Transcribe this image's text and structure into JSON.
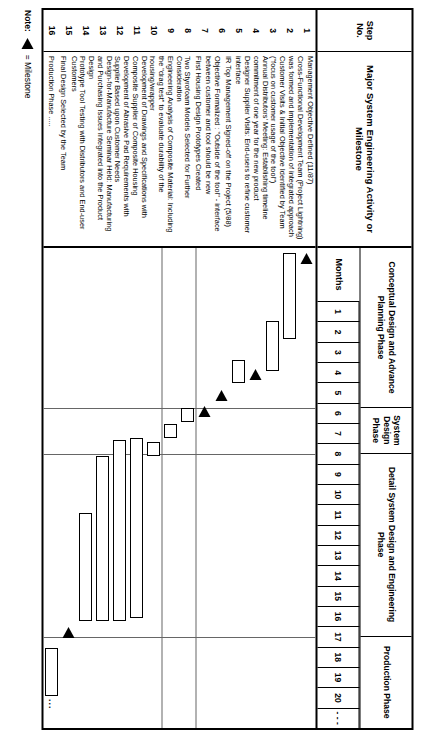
{
  "headers": {
    "step_no": "Step\nNo.",
    "step_no_line1": "Step",
    "step_no_line2": "No.",
    "activity": "Major System Engineering Activity or Milestone",
    "months": "Months"
  },
  "phases": [
    {
      "label": "Conceptual Design and Advance Planning Phase",
      "start_month": 1,
      "end_month": 7
    },
    {
      "label": "System Design Phase",
      "start_month": 8,
      "end_month": 9
    },
    {
      "label": "Detail System Design and Engineering Phase",
      "start_month": 10,
      "end_month": 17
    },
    {
      "label": "Production Phase",
      "start_month": 18,
      "end_month": 21
    }
  ],
  "month_ticks": [
    "1",
    "2",
    "3",
    "4",
    "5",
    "6",
    "7",
    "8",
    "9",
    "10",
    "11",
    "12",
    "13",
    "14",
    "15",
    "16",
    "17",
    "18",
    "19",
    "20",
    "- - -"
  ],
  "rows": [
    {
      "no": "1",
      "activity": "Management Objective Defined (11/87)"
    },
    {
      "no": "2",
      "activity": "Cross-Functional Development Team (Project Lightning) was formed and implementation of integrated approach"
    },
    {
      "no": "3",
      "activity": "Customer Visits & Initial Objective Identified by Team (\"focus on customer usage of the tool\")"
    },
    {
      "no": "4",
      "activity": "Annual Distributors' Meeting: Establishing timeline commitment of one year for the new product"
    },
    {
      "no": "5",
      "activity": "Designer Supplier Visits: End-users to refine customer interface"
    },
    {
      "no": "6",
      "activity": "IR Top Management Signed-off on the Project (5/88)"
    },
    {
      "no": "7",
      "activity": "Objective Formalized : \"Outside of the tool\" - interface between customer and tool should be new"
    },
    {
      "no": "8",
      "activity": "First Housing Design Prototypes Created"
    },
    {
      "no": "9",
      "activity": "Two Styrofoam Models Selected for Further Consideration"
    },
    {
      "no": "10",
      "activity": "Engineering Analysis of Composite Material: Including the \"drag test\" to evaluate durability of the housing/wrapper"
    },
    {
      "no": "11",
      "activity": "Development of Drawings and Specifications with Composite Supplier of Composite Housing"
    },
    {
      "no": "12",
      "activity": "Development of Abrasive Pad Requirements with Supplier Based upon Customer Needs"
    },
    {
      "no": "13",
      "activity": "Design-for-Manufacture Seminar Held: Manufacturing and Purchasing Issues Integrated into the Product Design"
    },
    {
      "no": "14",
      "activity": "Prototype Tool Testing with Distributors and End-user Customers"
    },
    {
      "no": "15",
      "activity": "Final Design Selected by the Team"
    },
    {
      "no": "16",
      "activity": "Production Phase ....."
    }
  ],
  "note": {
    "label": "Note:",
    "icon": "milestone-triangle",
    "text": "= Milestone"
  },
  "colors": {
    "ink": "#000000",
    "rule": "#666666",
    "paper": "#ffffff"
  },
  "chart_data": {
    "type": "gantt",
    "title": "Major System Engineering Activity or Milestone",
    "xlabel": "Months",
    "xlim": [
      1,
      21
    ],
    "grid": true,
    "tasks": [
      {
        "step": 1,
        "kind": "milestone",
        "at": 1.2
      },
      {
        "step": 2,
        "kind": "bar",
        "start": 1.2,
        "end": 5.0
      },
      {
        "step": 3,
        "kind": "bar",
        "start": 4.2,
        "end": 6.4
      },
      {
        "step": 4,
        "kind": "milestone",
        "at": 6.3
      },
      {
        "step": 5,
        "kind": "bar",
        "start": 5.9,
        "end": 6.9
      },
      {
        "step": 6,
        "kind": "milestone",
        "at": 7.2
      },
      {
        "step": 7,
        "kind": "milestone",
        "at": 7.9
      },
      {
        "step": 8,
        "kind": "bar",
        "start": 8.0,
        "end": 8.6
      },
      {
        "step": 9,
        "kind": "bar",
        "start": 8.7,
        "end": 9.3
      },
      {
        "step": 10,
        "kind": "bar",
        "start": 9.5,
        "end": 10.1
      },
      {
        "step": 11,
        "kind": "bar",
        "start": 9.3,
        "end": 17.2
      },
      {
        "step": 12,
        "kind": "bar",
        "start": 9.4,
        "end": 17.3
      },
      {
        "step": 13,
        "kind": "bar",
        "start": 10.1,
        "end": 17.3
      },
      {
        "step": 14,
        "kind": "bar",
        "start": 12.6,
        "end": 17.3
      },
      {
        "step": 15,
        "kind": "milestone",
        "at": 17.6
      },
      {
        "step": 16,
        "kind": "bar",
        "start": 18.5,
        "end": 20.6,
        "trailing_dots": "..."
      }
    ],
    "milestone_link": {
      "from_step": 4,
      "to_step": 15,
      "at_month": 18.0
    }
  }
}
